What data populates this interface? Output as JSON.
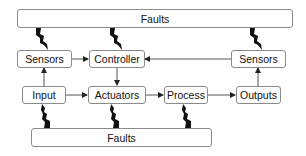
{
  "diagram": {
    "colors": {
      "box_border": "#8a8a8a",
      "box_fill": "#ffffff",
      "text": "#111111",
      "arrow": "#333333",
      "bolt": "#111111"
    },
    "nodes": {
      "faults_top": {
        "label": "Faults"
      },
      "sensors_left": {
        "label": "Sensors"
      },
      "controller": {
        "label": "Controller"
      },
      "sensors_right": {
        "label": "Sensors"
      },
      "input": {
        "label": "Input"
      },
      "actuators": {
        "label": "Actuators"
      },
      "process": {
        "label": "Process"
      },
      "outputs": {
        "label": "Outputs"
      },
      "faults_bottom": {
        "label": "Faults"
      }
    },
    "edges": [
      {
        "from": "sensors_left",
        "to": "controller",
        "type": "arrow"
      },
      {
        "from": "sensors_right",
        "to": "controller",
        "type": "arrow"
      },
      {
        "from": "controller",
        "to": "actuators",
        "type": "arrow"
      },
      {
        "from": "input",
        "to": "sensors_left",
        "type": "arrow"
      },
      {
        "from": "input",
        "to": "actuators",
        "type": "arrow"
      },
      {
        "from": "actuators",
        "to": "process",
        "type": "arrow"
      },
      {
        "from": "process",
        "to": "outputs",
        "type": "arrow"
      },
      {
        "from": "outputs",
        "to": "sensors_right",
        "type": "arrow"
      },
      {
        "from": "faults_top",
        "to": "sensors_left",
        "type": "fault-bolt"
      },
      {
        "from": "faults_top",
        "to": "controller",
        "type": "fault-bolt"
      },
      {
        "from": "faults_top",
        "to": "sensors_right",
        "type": "fault-bolt"
      },
      {
        "from": "faults_bottom",
        "to": "input",
        "type": "fault-bolt"
      },
      {
        "from": "faults_bottom",
        "to": "actuators",
        "type": "fault-bolt"
      },
      {
        "from": "faults_bottom",
        "to": "process",
        "type": "fault-bolt"
      }
    ]
  }
}
